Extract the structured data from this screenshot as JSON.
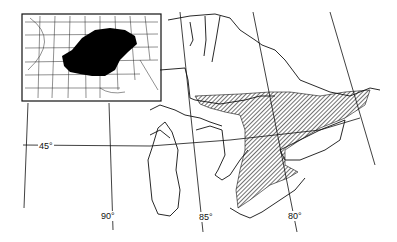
{
  "map": {
    "description": "Range map of the Great Lakes region with hatched distribution area in southern Ontario; inset shows eastern North America with solid black range",
    "latitude_labels": [
      {
        "label": "45°",
        "x": 38,
        "y": 141
      }
    ],
    "longitude_labels": [
      {
        "label": "90°",
        "x": 100,
        "y": 211
      },
      {
        "label": "85°",
        "x": 198,
        "y": 212
      },
      {
        "label": "80°",
        "x": 287,
        "y": 211
      }
    ],
    "colors": {
      "ink": "#111111",
      "background": "#ffffff",
      "range_fill": "#000000"
    },
    "inset": {
      "label": "North America inset",
      "range": "solid black"
    },
    "main": {
      "range": "hatched"
    }
  }
}
